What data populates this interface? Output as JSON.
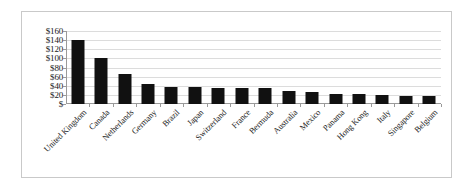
{
  "chart_data": {
    "type": "bar",
    "title": "",
    "subtitle": "",
    "xlabel": "",
    "ylabel": "",
    "ylim": [
      0,
      160
    ],
    "grid": true,
    "legend": false,
    "legend_position": "none",
    "orientation": "vertical",
    "bar_color": "#111111",
    "gridline_color": "#dcdcdc",
    "axis_color": "#9a9a9a",
    "frame_color": "#c9c9c9",
    "background_color": "#ffffff",
    "y_tick_labels": [
      "$160",
      "$140",
      "$120",
      "$100",
      "$80",
      "$60",
      "$40",
      "$20",
      "$"
    ],
    "y_tick_values": [
      160,
      140,
      120,
      100,
      80,
      60,
      40,
      20,
      0
    ],
    "categories": [
      "United Kingdom",
      "Canada",
      "Netherlands",
      "Germany",
      "Brazil",
      "Japan",
      "Switzerland",
      "France",
      "Bermuda",
      "Australia",
      "Mexico",
      "Panama",
      "Hong Kong",
      "Italy",
      "Singapore",
      "Belgium"
    ],
    "values": [
      140,
      101,
      65,
      44,
      37,
      37,
      36,
      36,
      35,
      28,
      27,
      23,
      21,
      19,
      18,
      18
    ]
  }
}
